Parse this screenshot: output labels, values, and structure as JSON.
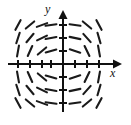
{
  "figure": {
    "kind": "slope-field",
    "width": 131,
    "height": 125,
    "background_color": "#ffffff",
    "stroke_color": "#1a1a1a",
    "axis_color": "#111111"
  },
  "axes": {
    "x_label": "x",
    "y_label": "y",
    "origin": {
      "x": 63,
      "y": 64
    },
    "x_axis": {
      "x1": 8,
      "y1": 64,
      "x2": 122,
      "y2": 64,
      "arrow": "right"
    },
    "y_axis": {
      "x1": 63,
      "y1": 112,
      "x2": 63,
      "y2": 10,
      "arrow": "up"
    },
    "x_label_pos": {
      "x": 110,
      "y": 77
    },
    "y_label_pos": {
      "x": 45,
      "y": 13
    },
    "x_ticks": [
      18,
      30,
      42,
      51,
      75,
      87,
      99
    ],
    "y_ticks": [
      25,
      38,
      51,
      77,
      90,
      103
    ],
    "tick_half_length": 4
  },
  "chart_data": {
    "type": "scatter",
    "title": "",
    "xlabel": "x",
    "ylabel": "y",
    "grid_columns_px": [
      18,
      30,
      42,
      51,
      75,
      87,
      99
    ],
    "grid_rows_px": [
      25,
      38,
      51,
      77,
      90,
      103
    ],
    "segment_length": 11,
    "segments": [
      {
        "cx": 18,
        "cy": 25,
        "angle_deg": -62
      },
      {
        "cx": 30,
        "cy": 25,
        "angle_deg": -40
      },
      {
        "cx": 42,
        "cy": 25,
        "angle_deg": -20
      },
      {
        "cx": 51,
        "cy": 25,
        "angle_deg": -8
      },
      {
        "cx": 75,
        "cy": 25,
        "angle_deg": 8
      },
      {
        "cx": 87,
        "cy": 25,
        "angle_deg": 40
      },
      {
        "cx": 99,
        "cy": 25,
        "angle_deg": 62
      },
      {
        "cx": 18,
        "cy": 38,
        "angle_deg": -72
      },
      {
        "cx": 30,
        "cy": 38,
        "angle_deg": -50
      },
      {
        "cx": 42,
        "cy": 38,
        "angle_deg": -26
      },
      {
        "cx": 51,
        "cy": 38,
        "angle_deg": -10
      },
      {
        "cx": 75,
        "cy": 38,
        "angle_deg": 12
      },
      {
        "cx": 87,
        "cy": 38,
        "angle_deg": 48
      },
      {
        "cx": 99,
        "cy": 38,
        "angle_deg": 74
      },
      {
        "cx": 18,
        "cy": 51,
        "angle_deg": -80
      },
      {
        "cx": 30,
        "cy": 51,
        "angle_deg": -66
      },
      {
        "cx": 42,
        "cy": 51,
        "angle_deg": -40
      },
      {
        "cx": 51,
        "cy": 51,
        "angle_deg": -16
      },
      {
        "cx": 75,
        "cy": 51,
        "angle_deg": 18
      },
      {
        "cx": 87,
        "cy": 51,
        "angle_deg": 64
      },
      {
        "cx": 99,
        "cy": 51,
        "angle_deg": 80
      },
      {
        "cx": 18,
        "cy": 77,
        "angle_deg": 80
      },
      {
        "cx": 30,
        "cy": 77,
        "angle_deg": 66
      },
      {
        "cx": 42,
        "cy": 77,
        "angle_deg": 40
      },
      {
        "cx": 51,
        "cy": 77,
        "angle_deg": 16
      },
      {
        "cx": 75,
        "cy": 77,
        "angle_deg": -18
      },
      {
        "cx": 87,
        "cy": 77,
        "angle_deg": -64
      },
      {
        "cx": 99,
        "cy": 77,
        "angle_deg": -80
      },
      {
        "cx": 18,
        "cy": 90,
        "angle_deg": 72
      },
      {
        "cx": 30,
        "cy": 90,
        "angle_deg": 50
      },
      {
        "cx": 42,
        "cy": 90,
        "angle_deg": 26
      },
      {
        "cx": 51,
        "cy": 90,
        "angle_deg": 10
      },
      {
        "cx": 75,
        "cy": 90,
        "angle_deg": -12
      },
      {
        "cx": 87,
        "cy": 90,
        "angle_deg": -48
      },
      {
        "cx": 99,
        "cy": 90,
        "angle_deg": -74
      },
      {
        "cx": 18,
        "cy": 103,
        "angle_deg": 62
      },
      {
        "cx": 30,
        "cy": 103,
        "angle_deg": 40
      },
      {
        "cx": 42,
        "cy": 103,
        "angle_deg": 20
      },
      {
        "cx": 51,
        "cy": 103,
        "angle_deg": 8
      },
      {
        "cx": 75,
        "cy": 103,
        "angle_deg": -8
      },
      {
        "cx": 87,
        "cy": 103,
        "angle_deg": -40
      },
      {
        "cx": 99,
        "cy": 103,
        "angle_deg": -62
      }
    ]
  }
}
